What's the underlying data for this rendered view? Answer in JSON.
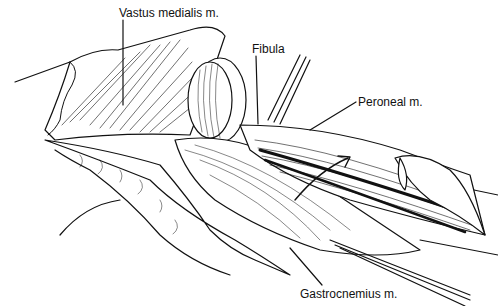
{
  "figure": {
    "labels": [
      {
        "id": "vastus",
        "text": "Vastus medialis m.",
        "x": 119,
        "y": 6
      },
      {
        "id": "fibula",
        "text": "Fibula",
        "x": 252,
        "y": 42
      },
      {
        "id": "peroneal",
        "text": "Peroneal m.",
        "x": 358,
        "y": 95
      },
      {
        "id": "gastrocnemius",
        "text": "Gastrocnemius m.",
        "x": 300,
        "y": 287
      }
    ],
    "colors": {
      "ink": "#111111",
      "paper": "#ffffff"
    }
  }
}
